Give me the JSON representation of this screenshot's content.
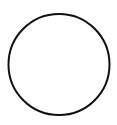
{
  "diagram": {
    "shape": "circle",
    "stroke_color": "#111111",
    "fill_color": "#ffffff",
    "background": "#ffffff"
  }
}
